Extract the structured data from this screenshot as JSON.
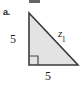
{
  "figure": {
    "part_label": "a.",
    "shape": "right-triangle",
    "fill_color": "#e3e3e3",
    "stroke_color": "#3b3b3b",
    "text_color": "#1f1f1f",
    "background_color": "#ffffff",
    "right_angle_marker": {
      "present": true,
      "vertex": "bottom-left"
    },
    "vertices": {
      "top": [
        29,
        13
      ],
      "bottom_left": [
        29,
        65
      ],
      "bottom_right": [
        78,
        65
      ]
    },
    "labels": {
      "left_leg": "5",
      "bottom_leg": "5",
      "hypotenuse_base": "z",
      "hypotenuse_subscript": "1"
    }
  }
}
